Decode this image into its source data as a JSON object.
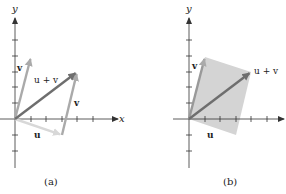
{
  "panels": [
    {
      "id": "a",
      "caption": "(a)",
      "x_axis_label": "x",
      "y_axis_label": "y",
      "vectors": [
        {
          "name": "u",
          "label": "u",
          "from": [
            0,
            0
          ],
          "to": [
            3,
            -1
          ],
          "color": "#d8d8d8"
        },
        {
          "name": "v",
          "label": "v",
          "from": [
            0,
            0
          ],
          "to": [
            1,
            4
          ],
          "color": "#aaaaaa"
        },
        {
          "name": "v-translated",
          "label": "v",
          "from": [
            3,
            -1
          ],
          "to": [
            4,
            3
          ],
          "color": "#aaaaaa"
        },
        {
          "name": "u+v",
          "label": "u + v",
          "from": [
            0,
            0
          ],
          "to": [
            4,
            3
          ],
          "color": "#6e6e6e"
        }
      ]
    },
    {
      "id": "b",
      "caption": "(b)",
      "x_axis_label": "",
      "y_axis_label": "y",
      "parallelogram_fill": "#d0d0d0",
      "vectors": [
        {
          "name": "v",
          "label": "v",
          "from": [
            0,
            0
          ],
          "to": [
            1,
            4
          ],
          "color": "#999999"
        },
        {
          "name": "u+v",
          "label": "u + v",
          "from": [
            0,
            0
          ],
          "to": [
            4,
            3
          ],
          "color": "#6e6e6e"
        }
      ],
      "u_label": "u"
    }
  ],
  "labels": {
    "a_x": "x",
    "a_y": "y",
    "a_v1": "v",
    "a_uv": "u + v",
    "a_v2": "v",
    "a_u": "u",
    "a_caption": "(a)",
    "b_y": "y",
    "b_v": "v",
    "b_uv": "u + v",
    "b_u": "u",
    "b_caption": "(b)"
  }
}
